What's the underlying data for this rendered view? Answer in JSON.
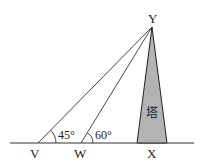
{
  "diagram": {
    "points": {
      "V": {
        "label": "V"
      },
      "W": {
        "label": "W"
      },
      "X": {
        "label": "X"
      },
      "Y": {
        "label": "Y"
      }
    },
    "angles": {
      "at_V": "45°",
      "at_W": "60°"
    },
    "tower_label": "塔",
    "colors": {
      "line": "#333333",
      "tower_fill": "#b3b3b3"
    }
  }
}
